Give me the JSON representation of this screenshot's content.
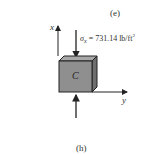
{
  "figure": {
    "top_label": "(e)",
    "caption": "(h)",
    "element_label": "C",
    "stress_symbol": "σ",
    "stress_subscript": "x",
    "stress_value": "= 731.14 lb/ft",
    "stress_unit_exp": "2",
    "axis_x_label": "x",
    "axis_y_label": "y"
  },
  "colors": {
    "front_face": "#8f8f8f",
    "top_face": "#a8a8a8",
    "side_face": "#6e6e6e",
    "stroke": "#222222"
  }
}
